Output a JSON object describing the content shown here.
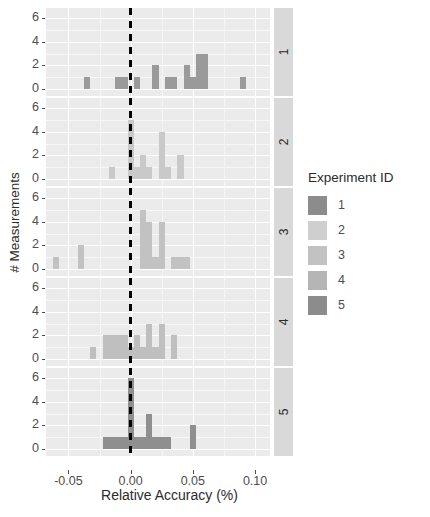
{
  "chart_data": {
    "type": "bar",
    "subtype": "faceted-histogram",
    "title": "",
    "xlabel": "Relative Accuracy (%)",
    "ylabel": "# Measurements",
    "xlim": [
      -0.068,
      0.112
    ],
    "ylim": [
      0,
      6.6
    ],
    "xticks": [
      -0.05,
      0.0,
      0.05,
      0.1
    ],
    "xticklabels": [
      "-0.05",
      "0.00",
      "0.05",
      "0.10"
    ],
    "yticks": [
      0,
      2,
      4,
      6
    ],
    "yticklabels": [
      "0",
      "2",
      "4",
      "6"
    ],
    "grid": true,
    "reference_line": {
      "x": 0.0,
      "style": "dashed",
      "color": "#000000"
    },
    "binwidth": 0.005,
    "legend": {
      "title": "Experiment ID",
      "position": "right",
      "entries": [
        {
          "label": "1",
          "color": "#8c8c8c"
        },
        {
          "label": "2",
          "color": "#cfcfcf"
        },
        {
          "label": "3",
          "color": "#c2c2c2"
        },
        {
          "label": "4",
          "color": "#b5b5b5"
        },
        {
          "label": "5",
          "color": "#8c8c8c"
        }
      ]
    },
    "facets": [
      {
        "strip_label": "1",
        "color": "#9a9a9a",
        "bins": [
          {
            "x0": -0.0375,
            "x1": -0.0325,
            "count": 1
          },
          {
            "x0": -0.0125,
            "x1": -0.0075,
            "count": 1
          },
          {
            "x0": -0.0075,
            "x1": -0.0025,
            "count": 1
          },
          {
            "x0": 0.0025,
            "x1": 0.0075,
            "count": 1
          },
          {
            "x0": 0.0175,
            "x1": 0.0225,
            "count": 2
          },
          {
            "x0": 0.0275,
            "x1": 0.0325,
            "count": 1
          },
          {
            "x0": 0.0325,
            "x1": 0.0375,
            "count": 1
          },
          {
            "x0": 0.0425,
            "x1": 0.0475,
            "count": 2
          },
          {
            "x0": 0.0475,
            "x1": 0.0525,
            "count": 1
          },
          {
            "x0": 0.0525,
            "x1": 0.0575,
            "count": 3
          },
          {
            "x0": 0.0575,
            "x1": 0.0625,
            "count": 3
          },
          {
            "x0": 0.0875,
            "x1": 0.0925,
            "count": 1
          }
        ]
      },
      {
        "strip_label": "2",
        "color": "#c9c9c9",
        "bins": [
          {
            "x0": -0.0175,
            "x1": -0.0125,
            "count": 1
          },
          {
            "x0": -0.0025,
            "x1": 0.0025,
            "count": 5
          },
          {
            "x0": 0.0025,
            "x1": 0.0075,
            "count": 1
          },
          {
            "x0": 0.0075,
            "x1": 0.0125,
            "count": 2
          },
          {
            "x0": 0.0125,
            "x1": 0.0175,
            "count": 1
          },
          {
            "x0": 0.0225,
            "x1": 0.0275,
            "count": 4
          },
          {
            "x0": 0.0275,
            "x1": 0.0325,
            "count": 1
          },
          {
            "x0": 0.0375,
            "x1": 0.0425,
            "count": 2
          }
        ]
      },
      {
        "strip_label": "3",
        "color": "#c2c2c2",
        "bins": [
          {
            "x0": -0.0625,
            "x1": -0.0575,
            "count": 1
          },
          {
            "x0": -0.0425,
            "x1": -0.0375,
            "count": 2
          },
          {
            "x0": 0.0075,
            "x1": 0.0125,
            "count": 5
          },
          {
            "x0": 0.0125,
            "x1": 0.0175,
            "count": 4
          },
          {
            "x0": 0.0175,
            "x1": 0.0225,
            "count": 1
          },
          {
            "x0": 0.0225,
            "x1": 0.0275,
            "count": 4
          },
          {
            "x0": 0.0325,
            "x1": 0.0375,
            "count": 1
          },
          {
            "x0": 0.0375,
            "x1": 0.0425,
            "count": 1
          },
          {
            "x0": 0.0425,
            "x1": 0.0475,
            "count": 1
          }
        ]
      },
      {
        "strip_label": "4",
        "color": "#bfbfbf",
        "bins": [
          {
            "x0": -0.0325,
            "x1": -0.0275,
            "count": 1
          },
          {
            "x0": -0.0225,
            "x1": -0.0175,
            "count": 2
          },
          {
            "x0": -0.0175,
            "x1": -0.0125,
            "count": 2
          },
          {
            "x0": -0.0125,
            "x1": -0.0075,
            "count": 2
          },
          {
            "x0": -0.0075,
            "x1": -0.0025,
            "count": 2
          },
          {
            "x0": -0.0025,
            "x1": 0.0025,
            "count": 1
          },
          {
            "x0": 0.0025,
            "x1": 0.0075,
            "count": 2
          },
          {
            "x0": 0.0075,
            "x1": 0.0125,
            "count": 1
          },
          {
            "x0": 0.0125,
            "x1": 0.0175,
            "count": 3
          },
          {
            "x0": 0.0175,
            "x1": 0.0225,
            "count": 1
          },
          {
            "x0": 0.0225,
            "x1": 0.0275,
            "count": 3
          },
          {
            "x0": 0.0325,
            "x1": 0.0375,
            "count": 2
          }
        ]
      },
      {
        "strip_label": "5",
        "color": "#8f8f8f",
        "bins": [
          {
            "x0": -0.0225,
            "x1": -0.0175,
            "count": 1
          },
          {
            "x0": -0.0175,
            "x1": -0.0125,
            "count": 1
          },
          {
            "x0": -0.0125,
            "x1": -0.0075,
            "count": 1
          },
          {
            "x0": -0.0075,
            "x1": -0.0025,
            "count": 1
          },
          {
            "x0": -0.0025,
            "x1": 0.0025,
            "count": 6
          },
          {
            "x0": 0.0025,
            "x1": 0.0075,
            "count": 1
          },
          {
            "x0": 0.0075,
            "x1": 0.0125,
            "count": 1
          },
          {
            "x0": 0.0125,
            "x1": 0.0175,
            "count": 3
          },
          {
            "x0": 0.0175,
            "x1": 0.0225,
            "count": 1
          },
          {
            "x0": 0.0225,
            "x1": 0.0275,
            "count": 1
          },
          {
            "x0": 0.0275,
            "x1": 0.0325,
            "count": 1
          },
          {
            "x0": 0.0475,
            "x1": 0.0525,
            "count": 2
          }
        ]
      }
    ]
  }
}
